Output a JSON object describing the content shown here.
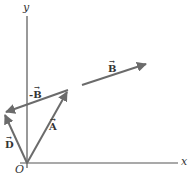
{
  "diagram": {
    "type": "vector-addition",
    "axes": {
      "x_label": "x",
      "y_label": "y",
      "origin_label": "O"
    },
    "vectors": [
      {
        "name": "A",
        "label": "A",
        "from": [
          27,
          163
        ],
        "to": [
          68,
          90
        ]
      },
      {
        "name": "-B",
        "label": "-B",
        "from": [
          68,
          90
        ],
        "to": [
          4,
          113
        ]
      },
      {
        "name": "D",
        "label": "D",
        "from": [
          27,
          163
        ],
        "to": [
          4,
          113
        ]
      },
      {
        "name": "B",
        "label": "B",
        "from": [
          82,
          85
        ],
        "to": [
          148,
          63
        ]
      }
    ],
    "colors": {
      "axis": "#555555",
      "vector": "#6b6b6b",
      "text": "#333333"
    }
  }
}
